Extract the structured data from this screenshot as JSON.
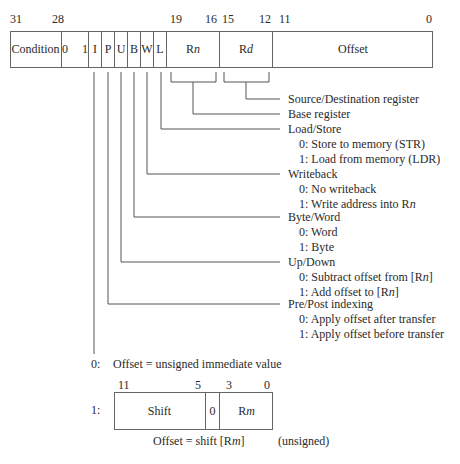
{
  "instruction_format": {
    "bit_positions": [
      {
        "label": "31",
        "x": 10
      },
      {
        "label": "28",
        "x": 53
      },
      {
        "label": "19",
        "x": 170
      },
      {
        "label": "16",
        "x": 205
      },
      {
        "label": "15",
        "x": 222
      },
      {
        "label": "12",
        "x": 260
      },
      {
        "label": "11",
        "x": 278
      },
      {
        "label": "0",
        "x": 426
      }
    ],
    "fields": [
      {
        "name": "condition",
        "label": "Condition",
        "left": 10,
        "width": 52
      },
      {
        "name": "fixed-01",
        "label": "0  1",
        "left": 62,
        "width": 27
      },
      {
        "name": "i-bit",
        "label": "I",
        "left": 89,
        "width": 13
      },
      {
        "name": "p-bit",
        "label": "P",
        "left": 102,
        "width": 13
      },
      {
        "name": "u-bit",
        "label": "U",
        "left": 115,
        "width": 13
      },
      {
        "name": "b-bit",
        "label": "B",
        "left": 128,
        "width": 13
      },
      {
        "name": "w-bit",
        "label": "W",
        "left": 141,
        "width": 13
      },
      {
        "name": "l-bit",
        "label": "L",
        "left": 154,
        "width": 13
      },
      {
        "name": "rn-field",
        "label_prefix": "R",
        "label_var": "n",
        "left": 167,
        "width": 53
      },
      {
        "name": "rd-field",
        "label_prefix": "R",
        "label_var": "d",
        "left": 220,
        "width": 53
      },
      {
        "name": "offset-field",
        "label": "Offset",
        "left": 273,
        "width": 160
      }
    ]
  },
  "descriptions": {
    "rd": {
      "title": "Source/Destination register"
    },
    "rn": {
      "title": "Base register"
    },
    "load_store": {
      "title": "Load/Store",
      "opt0": "0: Store to memory (STR)",
      "opt1": "1: Load from memory (LDR)"
    },
    "writeback": {
      "title": "Writeback",
      "opt0": "0: No writeback",
      "opt1_prefix": "1: Write address into R",
      "opt1_var": "n"
    },
    "byte_word": {
      "title": "Byte/Word",
      "opt0": "0: Word",
      "opt1": "1: Byte"
    },
    "up_down": {
      "title": "Up/Down",
      "opt0_prefix": "0: Subtract offset from [R",
      "opt0_var": "n",
      "opt0_suffix": "]",
      "opt1_prefix": "1: Add offset to [R",
      "opt1_var": "n",
      "opt1_suffix": "]"
    },
    "pre_post": {
      "title": "Pre/Post indexing",
      "opt0": "0: Apply offset after transfer",
      "opt1": "1: Apply offset before transfer"
    }
  },
  "offset_variants": {
    "immediate": {
      "key": "0:",
      "text": "Offset = unsigned immediate value"
    },
    "register": {
      "key": "1:",
      "bit_positions": [
        {
          "label": "11",
          "x": 119
        },
        {
          "label": "5",
          "x": 195
        },
        {
          "label": "3",
          "x": 226
        },
        {
          "label": "0",
          "x": 265
        }
      ],
      "fields": [
        {
          "name": "shift-field",
          "label": "Shift",
          "left": 114,
          "width": 92
        },
        {
          "name": "zero-bit",
          "label": "0",
          "left": 206,
          "width": 14
        },
        {
          "name": "rm-field",
          "label_prefix": "R",
          "label_var": "m",
          "left": 220,
          "width": 53
        }
      ],
      "caption_prefix": "Offset = shift [R",
      "caption_var": "m",
      "caption_suffix": "]",
      "caption_note": "(unsigned)"
    }
  },
  "colors": {
    "line": "#555555",
    "text": "#2a2a2a",
    "background": "#ffffff"
  }
}
